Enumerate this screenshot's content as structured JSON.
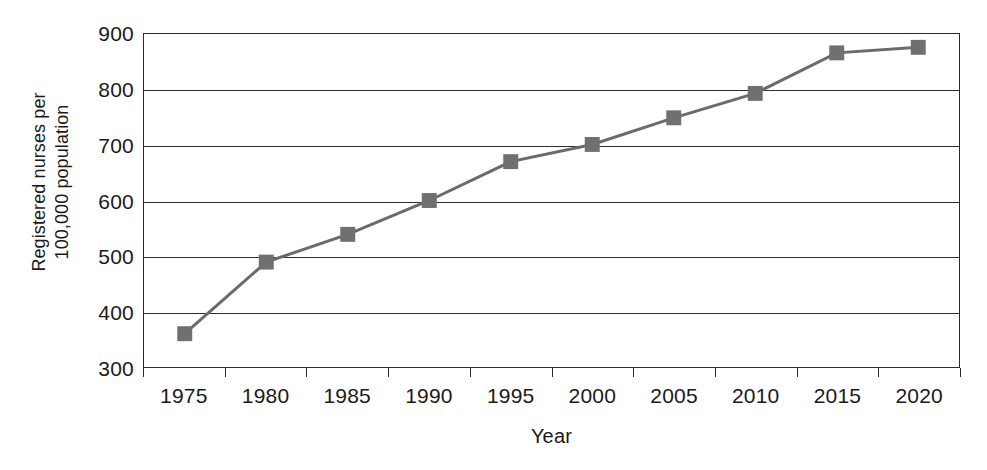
{
  "chart_data": {
    "type": "line",
    "title": "",
    "subtitle": "",
    "xlabel": "Year",
    "ylabel": "Registered nurses per 100,000 population",
    "ylabel_lines": [
      "Registered nurses per",
      "100,000 population"
    ],
    "categories": [
      "1975",
      "1980",
      "1985",
      "1990",
      "1995",
      "2000",
      "2005",
      "2010",
      "2015",
      "2020"
    ],
    "x": [
      1975,
      1980,
      1985,
      1990,
      1995,
      2000,
      2005,
      2010,
      2015,
      2020
    ],
    "values": [
      360,
      489,
      539,
      600,
      670,
      701,
      749,
      793,
      866,
      876
    ],
    "series": [
      {
        "name": "Registered nurses per 100,000 population",
        "values": [
          360,
          489,
          539,
          600,
          670,
          701,
          749,
          793,
          866,
          876
        ]
      }
    ],
    "ylim": [
      300,
      900
    ],
    "yticks": [
      300,
      400,
      500,
      600,
      700,
      800,
      900
    ],
    "ytick_labels": [
      "300",
      "400",
      "500",
      "600",
      "700",
      "800",
      "900"
    ],
    "xlim": [
      0,
      10
    ],
    "grid": true,
    "grid_axis": "y",
    "legend": false,
    "legend_position": "none",
    "marker": "square",
    "marker_size": 15,
    "annotations": []
  },
  "style": {
    "series_color": "#707070",
    "line_color": "#6b6b6b",
    "axis_color": "#2a2a2a",
    "grid_color": "#2f2f2f",
    "background": "#ffffff",
    "text_color": "#1a1a1a"
  }
}
